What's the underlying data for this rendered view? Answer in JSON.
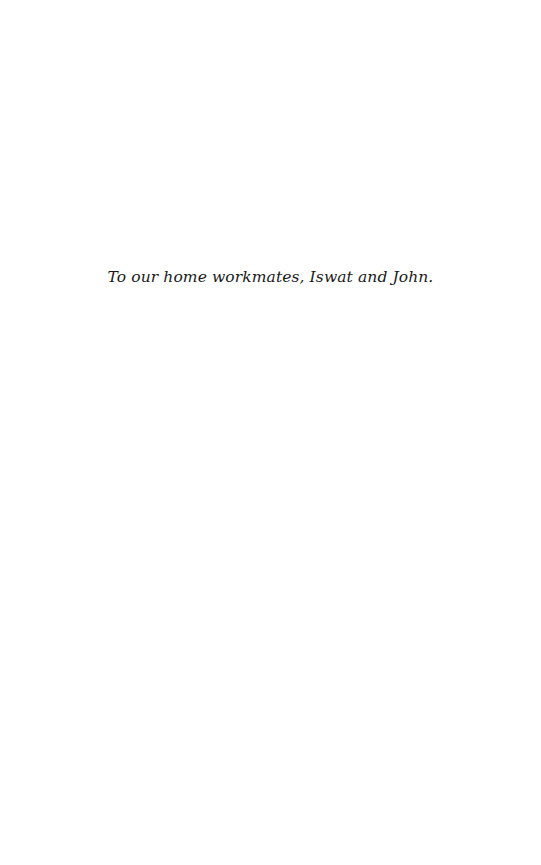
{
  "page": {
    "dedication": "To our home workmates, Iswat and John.",
    "background_color": "#ffffff",
    "text_color": "#1a1a1a"
  }
}
